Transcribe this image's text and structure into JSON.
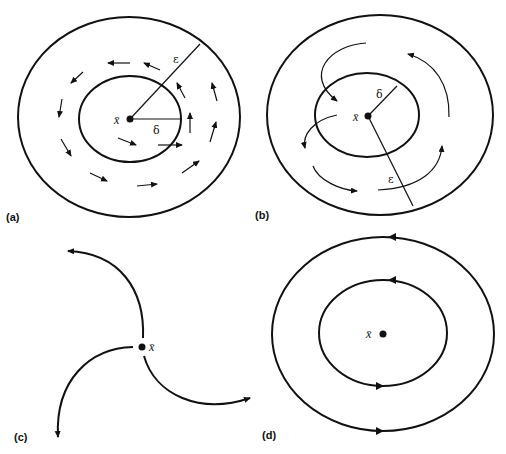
{
  "panels": [
    {
      "id": "a",
      "label": "(a)",
      "point_label": "x̄",
      "radius_labels": {
        "epsilon": "ε",
        "delta": "δ"
      },
      "description": "Stable equilibrium: trajectories starting within delta stay within epsilon"
    },
    {
      "id": "b",
      "label": "(b)",
      "point_label": "x̄",
      "radius_labels": {
        "epsilon": "ε",
        "delta": "δ"
      },
      "description": "Unstable equilibrium: trajectories leave epsilon-ball"
    },
    {
      "id": "c",
      "label": "(c)",
      "point_label": "x̄",
      "description": "Unstable equilibrium with diverging trajectories"
    },
    {
      "id": "d",
      "label": "(d)",
      "point_label": "x̄",
      "description": "Center: closed periodic orbits around equilibrium"
    }
  ]
}
